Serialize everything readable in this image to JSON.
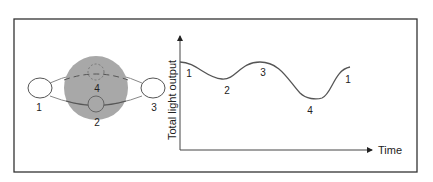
{
  "figure": {
    "frame_color": "#333333",
    "star_color": "#a6a6a6",
    "line_color": "#555555"
  },
  "orbit_diagram": {
    "positions": [
      {
        "id": "1",
        "label": "1",
        "description": "companion left of primary star"
      },
      {
        "id": "2",
        "label": "2",
        "description": "companion in front of primary star"
      },
      {
        "id": "3",
        "label": "3",
        "description": "companion right of primary star"
      },
      {
        "id": "4",
        "label": "4",
        "description": "companion behind primary star (eclipsed)"
      }
    ]
  },
  "light_curve": {
    "y_axis_label": "Total light output",
    "x_axis_label": "Time",
    "point_labels": [
      {
        "label": "1",
        "phase": "start, maximum"
      },
      {
        "label": "2",
        "phase": "shallow minimum"
      },
      {
        "label": "3",
        "phase": "maximum"
      },
      {
        "label": "4",
        "phase": "deep minimum"
      },
      {
        "label": "1",
        "phase": "return toward maximum"
      }
    ]
  }
}
